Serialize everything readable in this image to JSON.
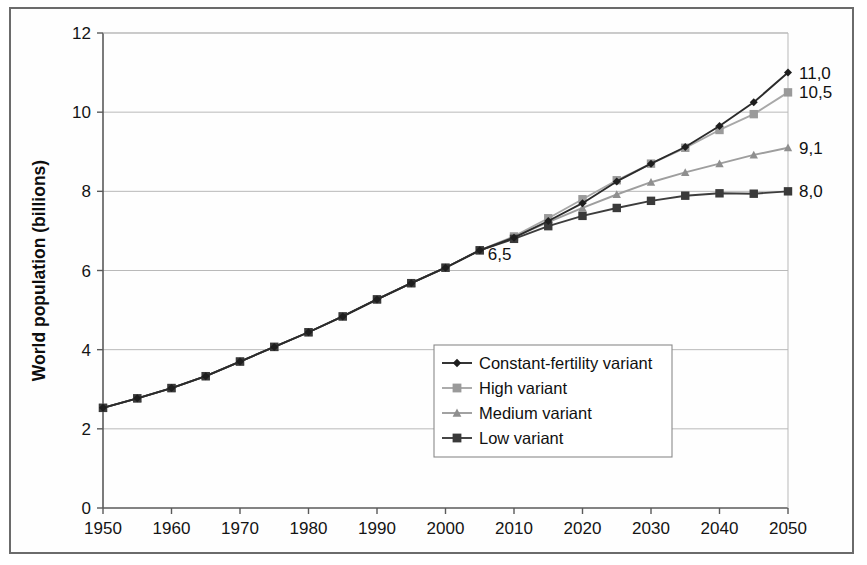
{
  "chart_data": {
    "type": "line",
    "title": "",
    "xlabel": "",
    "ylabel": "World population (billions)",
    "xlim": [
      1950,
      2050
    ],
    "ylim": [
      0,
      12
    ],
    "ytick_step": 2,
    "xtick_step": 10,
    "grid": true,
    "legend_position": "center-right-inside",
    "decimal_separator": ",",
    "xticks": [
      "1950",
      "1960",
      "1970",
      "1980",
      "1990",
      "2000",
      "2010",
      "2020",
      "2030",
      "2040",
      "2050"
    ],
    "yticks": [
      "0",
      "2",
      "4",
      "6",
      "8",
      "10",
      "12"
    ],
    "x": [
      1950,
      1955,
      1960,
      1965,
      1970,
      1975,
      1980,
      1985,
      1990,
      1995,
      2000,
      2005,
      2010,
      2015,
      2020,
      2025,
      2030,
      2035,
      2040,
      2045,
      2050
    ],
    "series": [
      {
        "name": "Constant-fertility variant",
        "color": "#2b2b2b",
        "marker": "diamond",
        "marker_color": "#1e1e1e",
        "values": [
          2.53,
          2.77,
          3.03,
          3.33,
          3.7,
          4.07,
          4.44,
          4.84,
          5.27,
          5.68,
          6.07,
          6.51,
          6.83,
          7.25,
          7.7,
          8.25,
          8.7,
          9.12,
          9.65,
          10.25,
          11.0
        ]
      },
      {
        "name": "High variant",
        "color": "#a8a8a8",
        "marker": "square",
        "marker_color": "#9a9a9a",
        "values": [
          2.53,
          2.77,
          3.03,
          3.33,
          3.7,
          4.07,
          4.44,
          4.84,
          5.27,
          5.68,
          6.07,
          6.51,
          6.86,
          7.32,
          7.8,
          8.28,
          8.7,
          9.1,
          9.55,
          9.95,
          10.5
        ]
      },
      {
        "name": "Medium variant",
        "color": "#9e9e9e",
        "marker": "triangle",
        "marker_color": "#8f8f8f",
        "values": [
          2.53,
          2.77,
          3.03,
          3.33,
          3.7,
          4.07,
          4.44,
          4.84,
          5.27,
          5.68,
          6.07,
          6.51,
          6.84,
          7.22,
          7.58,
          7.92,
          8.23,
          8.48,
          8.7,
          8.92,
          9.1
        ]
      },
      {
        "name": "Low variant",
        "color": "#3d3d3d",
        "marker": "square",
        "marker_color": "#3a3a3a",
        "values": [
          2.53,
          2.77,
          3.03,
          3.33,
          3.7,
          4.07,
          4.44,
          4.84,
          5.27,
          5.68,
          6.07,
          6.51,
          6.8,
          7.12,
          7.38,
          7.58,
          7.76,
          7.89,
          7.95,
          7.94,
          8.0
        ]
      }
    ],
    "end_labels": [
      {
        "series": "Constant-fertility variant",
        "text": "11,0",
        "value": 11.0
      },
      {
        "series": "High variant",
        "text": "10,5",
        "value": 10.5
      },
      {
        "series": "Medium variant",
        "text": "9,1",
        "value": 9.1
      },
      {
        "series": "Low variant",
        "text": "8,0",
        "value": 8.0
      }
    ],
    "annotations": [
      {
        "text": "6,5",
        "x": 2005,
        "y": 6.51
      }
    ]
  }
}
